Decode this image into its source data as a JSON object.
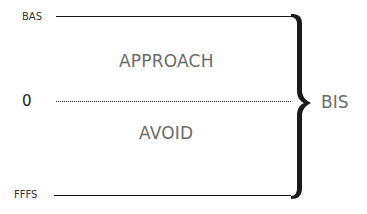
{
  "diagram": {
    "levels": {
      "top": {
        "label": "BAS"
      },
      "middle": {
        "label": "0"
      },
      "bottom": {
        "label": "FFFS"
      }
    },
    "regions": {
      "upper": {
        "label": "APPROACH"
      },
      "lower": {
        "label": "AVOID"
      }
    },
    "brace": {
      "label": "BIS"
    },
    "colors": {
      "line": "#1a1a1a",
      "region_text": "#6b6b6b",
      "level_text": "#333333"
    }
  }
}
